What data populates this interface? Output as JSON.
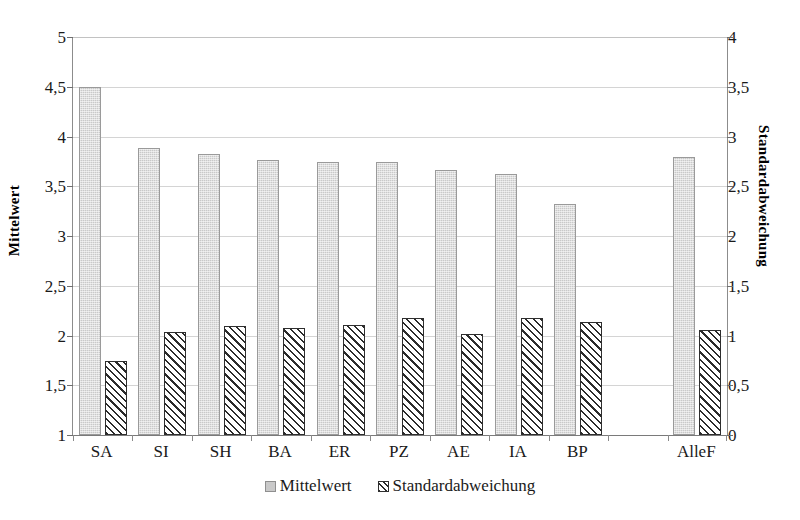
{
  "chart_data": {
    "type": "bar",
    "title": "",
    "xlabel": "",
    "categories": [
      "SA",
      "SI",
      "SH",
      "BA",
      "ER",
      "PZ",
      "AE",
      "IA",
      "BP",
      "",
      "AlleF"
    ],
    "series": [
      {
        "name": "Mittelwert",
        "axis": "left",
        "color": "#c9c9c9",
        "values": [
          4.5,
          3.88,
          3.82,
          3.76,
          3.74,
          3.74,
          3.66,
          3.62,
          3.32,
          null,
          3.79
        ]
      },
      {
        "name": "Standardabweichung",
        "axis": "right",
        "color": "#2b2b2b",
        "values": [
          0.74,
          1.04,
          1.1,
          1.08,
          1.11,
          1.18,
          1.02,
          1.18,
          1.14,
          null,
          1.06
        ]
      }
    ],
    "left_axis": {
      "label": "Mittelwert",
      "ticks": [
        "1",
        "1,5",
        "2",
        "2,5",
        "3",
        "3,5",
        "4",
        "4,5",
        "5"
      ],
      "tick_values": [
        1,
        1.5,
        2,
        2.5,
        3,
        3.5,
        4,
        4.5,
        5
      ],
      "ylim": [
        1,
        5
      ]
    },
    "right_axis": {
      "label": "Standardabweichung",
      "ticks": [
        "0",
        "0,5",
        "1",
        "1,5",
        "2",
        "2,5",
        "3",
        "3,5",
        "4"
      ],
      "tick_values": [
        0,
        0.5,
        1,
        1.5,
        2,
        2.5,
        3,
        3.5,
        4
      ],
      "ylim": [
        0,
        4
      ]
    },
    "legend": {
      "position": "bottom-center",
      "entries": [
        {
          "label": "Mittelwert",
          "swatch": "solid-gray"
        },
        {
          "label": "Standardabweichung",
          "swatch": "diagonal-hatch"
        }
      ]
    },
    "grid": true
  },
  "title_remnant": ""
}
